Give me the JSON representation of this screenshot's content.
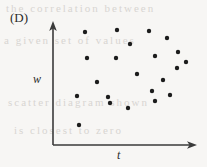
{
  "figure": {
    "panel_label": "(D)",
    "background_color": "#f7f6f4",
    "ink_color": "#1c1c1c",
    "axis_color": "#3a3a3a",
    "bleed_through_text": [
      {
        "text": "the correlation between",
        "x": 6,
        "y": 2
      },
      {
        "text": "a given set of values",
        "x": 4,
        "y": 34
      },
      {
        "text": "scatter diagram shown",
        "x": 8,
        "y": 96
      },
      {
        "text": "is closest to zero",
        "x": 14,
        "y": 124
      }
    ]
  },
  "chart_data": {
    "type": "scatter",
    "title": "(D)",
    "xlabel": "t",
    "ylabel": "w",
    "grid": false,
    "legend": null,
    "axis_style": "arrow-tipped, no tick marks, no tick labels",
    "xlim": [
      0,
      1
    ],
    "ylim": [
      0,
      1
    ],
    "series": [
      {
        "name": "observations",
        "marker": "filled-circle",
        "marker_color": "#1c1c1c",
        "marker_radius_px": 2.2,
        "n": 22,
        "points_px": [
          {
            "x": 85,
            "y": 32
          },
          {
            "x": 117,
            "y": 30
          },
          {
            "x": 149,
            "y": 31
          },
          {
            "x": 130,
            "y": 44
          },
          {
            "x": 167,
            "y": 38
          },
          {
            "x": 87,
            "y": 58
          },
          {
            "x": 116,
            "y": 58
          },
          {
            "x": 155,
            "y": 56
          },
          {
            "x": 178,
            "y": 52
          },
          {
            "x": 137,
            "y": 74
          },
          {
            "x": 177,
            "y": 68
          },
          {
            "x": 97,
            "y": 82
          },
          {
            "x": 163,
            "y": 80
          },
          {
            "x": 77,
            "y": 96
          },
          {
            "x": 108,
            "y": 97
          },
          {
            "x": 152,
            "y": 91
          },
          {
            "x": 170,
            "y": 95
          },
          {
            "x": 128,
            "y": 108
          },
          {
            "x": 155,
            "y": 101
          },
          {
            "x": 110,
            "y": 103
          },
          {
            "x": 79,
            "y": 125
          },
          {
            "x": 186,
            "y": 62
          }
        ],
        "relationship": "no apparent correlation"
      }
    ],
    "axes_px": {
      "origin": {
        "x": 53,
        "y": 145
      },
      "y_axis_top": {
        "x": 53,
        "y": 22
      },
      "x_axis_right": {
        "x": 196,
        "y": 145
      }
    }
  }
}
